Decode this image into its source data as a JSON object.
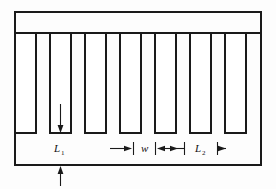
{
  "figure": {
    "background_color": "#fdfdfd",
    "line_color": "#1a1a1a",
    "fill_color": "#ffffff"
  },
  "labels": {
    "l1": {
      "base": "L",
      "subscript": "1",
      "full": "L1"
    },
    "w": {
      "base": "w",
      "subscript": "",
      "full": "w"
    },
    "l2": {
      "base": "L",
      "subscript": "2",
      "full": "L2"
    }
  },
  "geometry": {
    "outline": {
      "x": 14,
      "y": 11,
      "width": 248,
      "height": 155
    },
    "slot_top": 33,
    "slot_bottom": 133,
    "slot_width": 21,
    "slot_pitch": 35.2,
    "slot_count": 7,
    "slot_x_positions": [
      14,
      49,
      84,
      119,
      154,
      189,
      224
    ]
  },
  "annotations": {
    "l1_arrow": {
      "x": 63,
      "y_start": 104,
      "y_end": 132,
      "direction": "down"
    },
    "bottom_arrow": {
      "x": 63,
      "y_start": 186,
      "y_end": 167,
      "direction": "up"
    },
    "w_dimension": {
      "y": 148,
      "left_tick_x": 134,
      "right_tick_x": 155,
      "label_x": 144
    },
    "l2_dimension": {
      "y": 148,
      "left_tick_x": 184,
      "right_tick_x": 218,
      "label_x": 201
    }
  }
}
